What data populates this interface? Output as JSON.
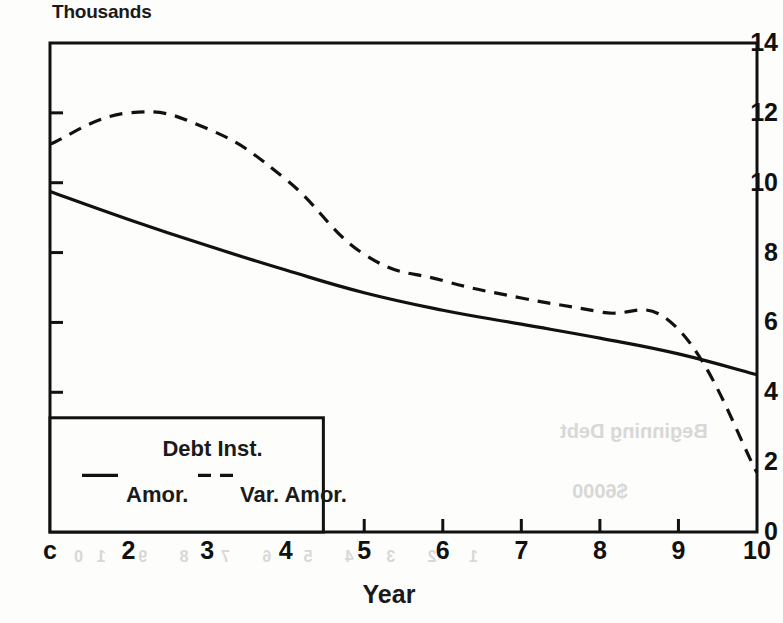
{
  "chart_data": {
    "type": "line",
    "title": "",
    "unit_label": "Thousands",
    "xlabel": "Year",
    "ylabel": "",
    "xlim": [
      1,
      10
    ],
    "ylim": [
      0,
      14
    ],
    "grid": false,
    "x": [
      1,
      2,
      3,
      4,
      5,
      6,
      7,
      8,
      9,
      10
    ],
    "xtick_labels": [
      "c",
      "2",
      "3",
      "4",
      "5",
      "6",
      "7",
      "8",
      "9",
      "10"
    ],
    "ytick_labels": [
      "0",
      "2",
      "4",
      "6",
      "8",
      "10",
      "12",
      "14"
    ],
    "ytick_values": [
      0,
      2,
      4,
      6,
      8,
      10,
      12,
      14
    ],
    "legend": {
      "title": "Debt Inst.",
      "position": "lower-left",
      "entries": [
        {
          "label": "Amor.",
          "style": "solid"
        },
        {
          "label": "Var. Amor.",
          "style": "dashed"
        }
      ]
    },
    "series": [
      {
        "name": "Amor.",
        "style": "solid",
        "color": "#111111",
        "values": [
          9.75,
          8.95,
          8.2,
          7.5,
          6.85,
          6.35,
          5.95,
          5.55,
          5.1,
          4.5
        ]
      },
      {
        "name": "Var. Amor.",
        "style": "dashed",
        "color": "#111111",
        "values": [
          11.1,
          12.0,
          11.55,
          10.1,
          7.95,
          7.2,
          6.7,
          6.3,
          5.8,
          1.7
        ]
      }
    ]
  },
  "artifacts": {
    "bleed_through": [
      "Beginning Debt",
      "$6000",
      "1  2  3  4  5  6  7  8  9  10"
    ]
  }
}
